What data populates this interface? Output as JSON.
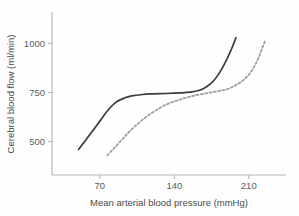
{
  "chart_data": {
    "type": "line",
    "title": "",
    "xlabel": "Mean arterial blood pressure (mmHg)",
    "ylabel": "Cerebral blood flow (ml/min)",
    "xlim": [
      25,
      245
    ],
    "ylim": [
      330,
      1160
    ],
    "xticks": [
      70,
      140,
      210
    ],
    "xticklabels": [
      "70",
      "140",
      "210"
    ],
    "yticks": [
      500,
      750,
      1000
    ],
    "yticklabels": [
      "500",
      "750",
      "1000"
    ],
    "grid": false,
    "legend": "none",
    "series": [
      {
        "name": "normal-autoregulation",
        "style": "solid",
        "color": "#3b3b42",
        "x": [
          50,
          57,
          64,
          71,
          78,
          85,
          93,
          100,
          110,
          120,
          133,
          145,
          155,
          163,
          170,
          177,
          183,
          189,
          194,
          198
        ],
        "y": [
          460,
          510,
          560,
          612,
          662,
          700,
          722,
          733,
          740,
          743,
          745,
          748,
          752,
          760,
          778,
          810,
          855,
          915,
          975,
          1030
        ]
      },
      {
        "name": "shifted-autoregulation",
        "style": "dashed",
        "color": "#9a9aa2",
        "x": [
          77,
          84,
          91,
          98,
          106,
          114,
          123,
          132,
          142,
          152,
          162,
          172,
          181,
          190,
          198,
          206,
          213,
          219,
          225
        ],
        "y": [
          430,
          470,
          512,
          552,
          592,
          628,
          660,
          688,
          708,
          725,
          738,
          748,
          757,
          768,
          788,
          818,
          862,
          925,
          1010
        ]
      }
    ]
  }
}
